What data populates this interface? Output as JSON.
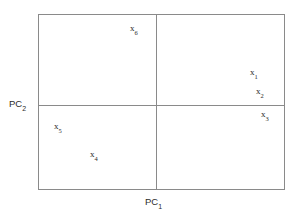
{
  "chart_data": {
    "type": "scatter",
    "title": "",
    "xlabel": "PC1",
    "ylabel": "PC2",
    "axes": {
      "x_axis_label_base": "PC",
      "x_axis_label_sub": "1",
      "y_axis_label_base": "PC",
      "y_axis_label_sub": "2"
    },
    "grid": false,
    "legend": null,
    "points": [
      {
        "name": "x6",
        "base": "x",
        "sub": "6",
        "x": -0.09,
        "y": 0.82,
        "quadrant": "upper-left"
      },
      {
        "name": "x1",
        "base": "x",
        "sub": "1",
        "x": 0.78,
        "y": 0.3,
        "quadrant": "upper-right"
      },
      {
        "name": "x2",
        "base": "x",
        "sub": "2",
        "x": 0.83,
        "y": 0.12,
        "quadrant": "upper-right"
      },
      {
        "name": "x3",
        "base": "x",
        "sub": "3",
        "x": 0.87,
        "y": -0.09,
        "quadrant": "lower-right"
      },
      {
        "name": "x5",
        "base": "x",
        "sub": "5",
        "x": -0.8,
        "y": -0.26,
        "quadrant": "lower-left"
      },
      {
        "name": "x4",
        "base": "x",
        "sub": "4",
        "x": -0.52,
        "y": -0.58,
        "quadrant": "lower-left"
      }
    ],
    "xlim": [
      -1,
      1
    ],
    "ylim": [
      -1,
      1
    ]
  },
  "style": {
    "line_color": "#8a8a8a",
    "text_color": "#2b2b2b",
    "background": "#ffffff"
  }
}
